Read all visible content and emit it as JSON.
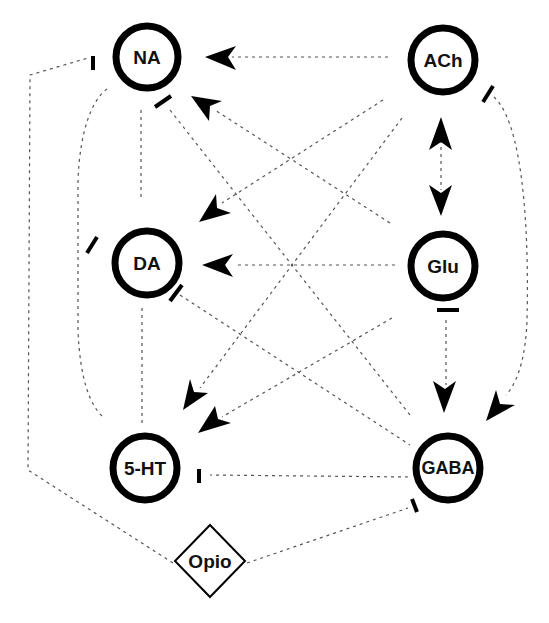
{
  "diagram": {
    "nodes": [
      {
        "id": "NA",
        "label": "NA",
        "shape": "circle"
      },
      {
        "id": "ACh",
        "label": "ACh",
        "shape": "circle"
      },
      {
        "id": "DA",
        "label": "DA",
        "shape": "circle"
      },
      {
        "id": "Glu",
        "label": "Glu",
        "shape": "circle"
      },
      {
        "id": "5-HT",
        "label": "5-HT",
        "shape": "circle"
      },
      {
        "id": "GABA",
        "label": "GABA",
        "shape": "circle"
      },
      {
        "id": "Opio",
        "label": "Opio",
        "shape": "diamond"
      }
    ],
    "edges": [
      {
        "from": "ACh",
        "to": "NA",
        "type": "activation"
      },
      {
        "from": "Glu",
        "to": "NA",
        "type": "activation"
      },
      {
        "from": "ACh",
        "to": "DA",
        "type": "activation"
      },
      {
        "from": "Glu",
        "to": "DA",
        "type": "activation"
      },
      {
        "from": "ACh",
        "to": "5-HT",
        "type": "activation"
      },
      {
        "from": "Glu",
        "to": "5-HT",
        "type": "activation"
      },
      {
        "from": "ACh",
        "to": "Glu",
        "type": "activation-bidirectional"
      },
      {
        "from": "Glu",
        "to": "GABA",
        "type": "activation"
      },
      {
        "from": "ACh",
        "to": "GABA",
        "type": "activation"
      },
      {
        "from": "GABA",
        "to": "NA",
        "type": "inhibition"
      },
      {
        "from": "GABA",
        "to": "DA",
        "type": "inhibition"
      },
      {
        "from": "GABA",
        "to": "5-HT",
        "type": "inhibition"
      },
      {
        "from": "Opio",
        "to": "GABA",
        "type": "inhibition"
      },
      {
        "from": "Opio",
        "to": "NA",
        "type": "inhibition"
      },
      {
        "from": "NA",
        "to": "DA",
        "type": "link"
      },
      {
        "from": "NA",
        "to": "5-HT",
        "type": "link"
      },
      {
        "from": "DA",
        "to": "5-HT",
        "type": "link"
      },
      {
        "from": "Glu",
        "to": "Glu",
        "type": "inhibition-marker"
      },
      {
        "from": "ACh",
        "to": "ACh",
        "type": "inhibition-marker"
      },
      {
        "from": "DA",
        "to": "DA",
        "type": "inhibition-marker"
      }
    ],
    "colors": {
      "node_stroke": "#000000",
      "edge": "#555555",
      "background": "#ffffff"
    }
  }
}
